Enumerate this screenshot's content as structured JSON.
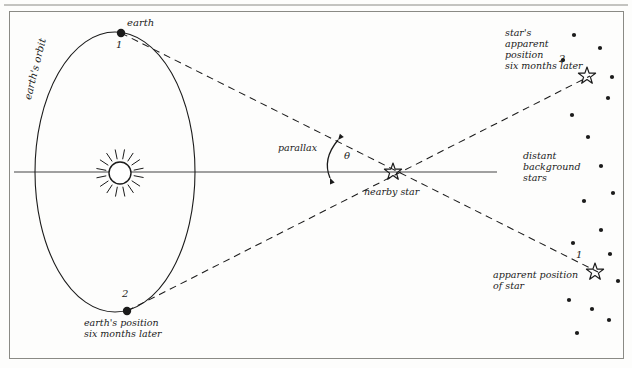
{
  "figure": {
    "type": "stellar-parallax-diagram",
    "frame": {
      "x": 9,
      "y": 11,
      "width": 614,
      "height": 347,
      "border_color": "#8a8a85"
    },
    "top_rule_color": "#8a8a85",
    "ink_color": "#1b1b1b"
  },
  "labels": {
    "earth": "earth",
    "earth_orbit": "earth's orbit",
    "earth_position_later": "earth's position\nsix months later",
    "parallax": "parallax",
    "theta": "θ",
    "nearby_star": "nearby star",
    "star_apparent_later": "star's\napparent\nposition\nsix months later",
    "distant_background_stars": "distant\nbackground\nstars",
    "apparent_position_of_star": "apparent position\nof star",
    "marker_one": "1",
    "marker_two": "2",
    "apparent_marker_one": "1",
    "apparent_marker_two": "2"
  },
  "objects": {
    "sun": {
      "cx": 120,
      "cy": 173,
      "r": 11,
      "rays": 16,
      "ray_inner": 14,
      "ray_outer": 24
    },
    "earth_orbit_ellipse": {
      "cx": 115,
      "cy": 172,
      "rx": 80,
      "ry": 140
    },
    "earth_1": {
      "cx": 121,
      "cy": 33,
      "r": 4.2
    },
    "earth_2": {
      "cx": 127,
      "cy": 311,
      "r": 4.2
    },
    "nearby_star": {
      "cx": 393,
      "cy": 172,
      "r": 9
    },
    "apparent_star_2": {
      "cx": 587,
      "cy": 76,
      "r": 9
    },
    "apparent_star_1": {
      "cx": 595,
      "cy": 272,
      "r": 9
    },
    "axis_line": {
      "x1": 14,
      "y1": 172,
      "x2": 497,
      "y2": 172
    }
  },
  "sight_lines": [
    {
      "name": "earth1-to-apparent1",
      "x1": 121,
      "y1": 33,
      "x2": 598,
      "y2": 272
    },
    {
      "name": "earth2-to-apparent2",
      "x1": 127,
      "y1": 311,
      "x2": 590,
      "y2": 76
    }
  ],
  "parallax_arc": {
    "x1": 330,
    "y1": 178,
    "x2": 338,
    "y2": 140,
    "bow": 12
  },
  "background_stars": [
    {
      "cx": 574,
      "cy": 35,
      "r": 2.1
    },
    {
      "cx": 600,
      "cy": 48,
      "r": 2.1
    },
    {
      "cx": 563,
      "cy": 60,
      "r": 2.1
    },
    {
      "cx": 612,
      "cy": 77,
      "r": 2.1
    },
    {
      "cx": 608,
      "cy": 98,
      "r": 2.1
    },
    {
      "cx": 572,
      "cy": 115,
      "r": 2.1
    },
    {
      "cx": 588,
      "cy": 137,
      "r": 2.1
    },
    {
      "cx": 601,
      "cy": 166,
      "r": 2.1
    },
    {
      "cx": 613,
      "cy": 193,
      "r": 2.1
    },
    {
      "cx": 584,
      "cy": 201,
      "r": 2.1
    },
    {
      "cx": 601,
      "cy": 230,
      "r": 2.1
    },
    {
      "cx": 573,
      "cy": 243,
      "r": 2.1
    },
    {
      "cx": 610,
      "cy": 254,
      "r": 2.1
    },
    {
      "cx": 618,
      "cy": 281,
      "r": 2.1
    },
    {
      "cx": 569,
      "cy": 300,
      "r": 2.1
    },
    {
      "cx": 592,
      "cy": 309,
      "r": 2.1
    },
    {
      "cx": 609,
      "cy": 320,
      "r": 2.1
    },
    {
      "cx": 577,
      "cy": 333,
      "r": 2.1
    }
  ],
  "label_positions": {
    "earth": {
      "left": 127,
      "top": 17,
      "size": 10
    },
    "marker_one": {
      "left": 116,
      "top": 39
    },
    "earth_orbit": {
      "left": 22,
      "top": 98,
      "size": 10,
      "rotate": -76
    },
    "marker_two": {
      "left": 122,
      "top": 288
    },
    "earth_position_later": {
      "left": 84,
      "top": 318,
      "size": 9.5
    },
    "parallax": {
      "left": 278,
      "top": 143,
      "size": 9.5
    },
    "theta": {
      "left": 344,
      "top": 150,
      "size": 10
    },
    "nearby_star": {
      "left": 364,
      "top": 187,
      "size": 9.5
    },
    "star_apparent_later": {
      "left": 505,
      "top": 28,
      "size": 9.5
    },
    "distant_background_stars": {
      "left": 523,
      "top": 151,
      "size": 9.5
    },
    "apparent_position_of_star": {
      "left": 493,
      "top": 270,
      "size": 9.5
    }
  }
}
